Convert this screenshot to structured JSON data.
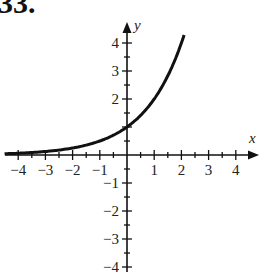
{
  "problem": {
    "number": "33."
  },
  "chart_data": {
    "type": "line",
    "title": "",
    "xlabel": "x",
    "ylabel": "y",
    "function": "y = 2^x",
    "xlim": [
      -4.5,
      4.8
    ],
    "ylim": [
      -4.2,
      4.8
    ],
    "x_ticks": [
      -4,
      -3,
      -2,
      -1,
      1,
      2,
      3,
      4
    ],
    "y_ticks": [
      -4,
      -3,
      -2,
      -1,
      1,
      2,
      3,
      4
    ],
    "x_tick_labels": [
      "−4",
      "−3",
      "−2",
      "−1",
      "1",
      "2",
      "3",
      "4"
    ],
    "y_tick_labels": [
      "4",
      "3",
      "2",
      "−1",
      "−2",
      "−3",
      "−4"
    ],
    "grid": false,
    "legend": null,
    "series": [
      {
        "name": "curve",
        "x": [
          -4.5,
          -4,
          -3,
          -2,
          -1,
          0,
          1,
          2,
          2.1
        ],
        "y": [
          0.044,
          0.0625,
          0.125,
          0.25,
          0.5,
          1,
          2,
          4,
          4.29
        ]
      }
    ],
    "annotations": [
      "y-intercept at (0, 1)",
      "horizontal asymptote y = 0"
    ]
  },
  "colors": {
    "ink": "#111111",
    "background": "#ffffff"
  }
}
